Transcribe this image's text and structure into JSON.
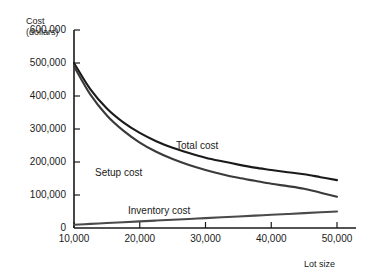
{
  "chart_data": {
    "type": "line",
    "title": "",
    "subtitle": "",
    "xlabel": "Lot size",
    "ylabel_line1": "Cost",
    "ylabel_line2": "(dollars)",
    "xlim": [
      10000,
      50000
    ],
    "ylim": [
      0,
      600000
    ],
    "grid": false,
    "legend_position": "inline-curve-labels",
    "x_ticks": [
      10000,
      20000,
      30000,
      40000,
      50000
    ],
    "x_tick_labels": [
      "10,000",
      "20,000",
      "30,000",
      "40,000",
      "50,000"
    ],
    "y_ticks": [
      0,
      100000,
      200000,
      300000,
      400000,
      500000,
      600000
    ],
    "y_tick_labels": [
      "0",
      "100,000",
      "200,000",
      "300,000",
      "400,000",
      "500,000",
      "600,000"
    ],
    "x": [
      10000,
      12500,
      15000,
      17500,
      20000,
      22500,
      25000,
      27500,
      30000,
      32500,
      35000,
      37500,
      40000,
      42500,
      45000,
      47500,
      50000
    ],
    "series": [
      {
        "name": "Total cost",
        "label": "Total cost",
        "color": "#1a1a1a",
        "values": [
          500000,
          420000,
          362000,
          320000,
          288000,
          263000,
          243000,
          227000,
          213000,
          202000,
          192000,
          183000,
          176000,
          169000,
          163000,
          154000,
          145000
        ]
      },
      {
        "name": "Setup cost",
        "label": "Setup cost",
        "color": "#3a3a3a",
        "values": [
          490000,
          404000,
          341000,
          295000,
          259000,
          231000,
          209000,
          191000,
          176000,
          163000,
          152000,
          143000,
          134000,
          127000,
          119000,
          107000,
          95000
        ]
      },
      {
        "name": "Inventory cost",
        "label": "Inventory cost",
        "color": "#4a4a4a",
        "values": [
          10000,
          12500,
          15000,
          17500,
          20000,
          22500,
          25000,
          27500,
          30000,
          32500,
          35000,
          37500,
          40000,
          42500,
          45000,
          47500,
          50000
        ]
      }
    ]
  },
  "axes": {
    "axis_color": "#1a1a1a"
  }
}
